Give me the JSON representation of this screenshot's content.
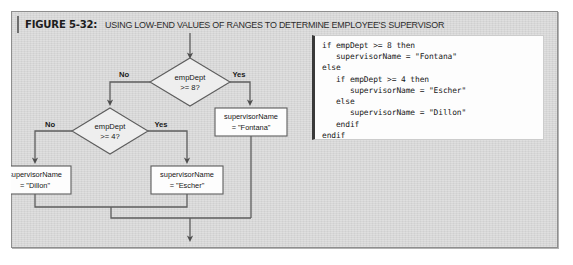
{
  "figure": {
    "label": "FIGURE 5-32:",
    "title": "USING LOW-END VALUES OF RANGES TO DETERMINE EMPLOYEE'S SUPERVISOR"
  },
  "flowchart": {
    "decisions": [
      {
        "id": "d1",
        "line1": "empDept",
        "line2": ">= 8?",
        "no_label": "No",
        "yes_label": "Yes"
      },
      {
        "id": "d2",
        "line1": "empDept",
        "line2": ">= 4?",
        "no_label": "No",
        "yes_label": "Yes"
      }
    ],
    "processes": [
      {
        "id": "p_fontana",
        "line1": "supervisorName",
        "line2": "= \"Fontana\""
      },
      {
        "id": "p_dillon",
        "line1": "supervisorName",
        "line2": "= \"Dillon\""
      },
      {
        "id": "p_escher",
        "line1": "supervisorName",
        "line2": "= \"Escher\""
      }
    ]
  },
  "code": {
    "text": "if empDept >= 8 then\n   supervisorName = \"Fontana\"\nelse\n   if empDept >= 4 then\n      supervisorName = \"Escher\"\n   else\n      supervisorName = \"Dillon\"\n   endif\nendif"
  },
  "colors": {
    "panel_bg": "#d7d7d7",
    "panel_border": "#8e8e8e",
    "node_fill": "#fdfdfd",
    "diamond_fill": "#eeeeee",
    "stroke": "#5d5d5d",
    "code_bg": "#fdfdfd",
    "code_accent": "#3a3a3a"
  }
}
